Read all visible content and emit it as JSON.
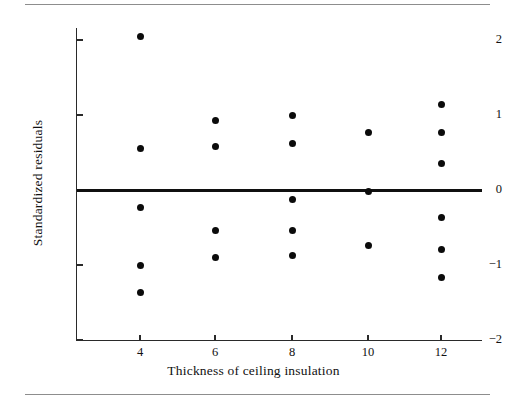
{
  "chart_data": {
    "type": "scatter",
    "title": "",
    "xlabel": "Thickness of ceiling insulation",
    "ylabel": "Standardized residuals",
    "xlim": [
      2.7,
      13.5
    ],
    "ylim": [
      -2,
      2.25
    ],
    "grid": false,
    "legend": null,
    "xticks": [
      4,
      6,
      8,
      10,
      12
    ],
    "xtick_labels": [
      "4",
      "6",
      "8",
      "10",
      "12"
    ],
    "yticks": [
      2,
      1,
      0,
      -1,
      -2
    ],
    "ytick_labels": [
      "2",
      "1",
      "0",
      "−1",
      "−2"
    ],
    "reference_line": {
      "y": 0,
      "style": "solid",
      "color": "#101010",
      "width": 3
    },
    "x": [
      4,
      4,
      4,
      4,
      4,
      6,
      6,
      6,
      6,
      8,
      8,
      8,
      8,
      8,
      10,
      10,
      10,
      12,
      12,
      12,
      12,
      12,
      12
    ],
    "y": [
      2.05,
      0.56,
      -0.23,
      -1.0,
      -1.37,
      0.93,
      0.58,
      -0.54,
      -0.9,
      1.0,
      0.62,
      -0.13,
      -0.54,
      -0.87,
      0.77,
      -0.02,
      -0.74,
      1.14,
      0.77,
      0.36,
      -0.37,
      -0.79,
      -1.16
    ],
    "points": [
      {
        "x": 4,
        "y": 2.05
      },
      {
        "x": 4,
        "y": 0.56
      },
      {
        "x": 4,
        "y": -0.23
      },
      {
        "x": 4,
        "y": -1.0
      },
      {
        "x": 4,
        "y": -1.37
      },
      {
        "x": 6,
        "y": 0.93
      },
      {
        "x": 6,
        "y": 0.58
      },
      {
        "x": 6,
        "y": -0.54
      },
      {
        "x": 6,
        "y": -0.9
      },
      {
        "x": 8,
        "y": 1.0
      },
      {
        "x": 8,
        "y": 0.62
      },
      {
        "x": 8,
        "y": -0.13
      },
      {
        "x": 8,
        "y": -0.54
      },
      {
        "x": 8,
        "y": -0.87
      },
      {
        "x": 10,
        "y": 0.77
      },
      {
        "x": 10,
        "y": -0.02
      },
      {
        "x": 10,
        "y": -0.74
      },
      {
        "x": 12,
        "y": 1.14
      },
      {
        "x": 12,
        "y": 0.77
      },
      {
        "x": 12,
        "y": 0.36
      },
      {
        "x": 12,
        "y": -0.37
      },
      {
        "x": 12,
        "y": -0.79
      },
      {
        "x": 12,
        "y": -1.16
      }
    ],
    "marker": {
      "shape": "circle",
      "filled": true,
      "color": "#0b0b0b",
      "size": 7
    }
  },
  "colors": {
    "axis": "#2a2a2a",
    "marker": "#0b0b0b",
    "reference_line": "#101010",
    "rule": "#8d8d8d",
    "background": "#ffffff"
  }
}
